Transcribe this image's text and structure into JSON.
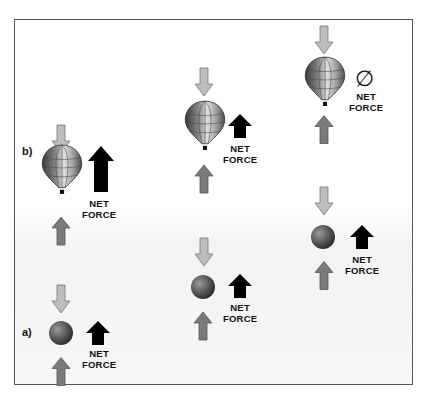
{
  "diagram": {
    "panel_labels": {
      "a": "a)",
      "b": "b)"
    },
    "net_force_label_line1": "NET",
    "net_force_label_line2": "FORCE",
    "zero_symbol": "∅",
    "colors": {
      "down_arrow_fill": "#bdbdbd",
      "up_arrow_fill": "#7a7a7a",
      "net_arrow_fill": "#000000",
      "frame_border": "#555555"
    },
    "scenes": [
      {
        "id": "balloon-b-left",
        "object": "balloon",
        "net_force": "large-up"
      },
      {
        "id": "balloon-middle",
        "object": "balloon",
        "net_force": "up"
      },
      {
        "id": "balloon-right",
        "object": "balloon",
        "net_force": "zero"
      },
      {
        "id": "ball-a-left",
        "object": "ball",
        "net_force": "up"
      },
      {
        "id": "ball-middle",
        "object": "ball",
        "net_force": "up"
      },
      {
        "id": "ball-right",
        "object": "ball",
        "net_force": "up"
      }
    ]
  }
}
